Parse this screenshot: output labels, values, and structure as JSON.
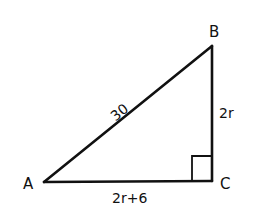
{
  "diagram": {
    "type": "right-triangle",
    "stroke_color": "#111111",
    "background": "#ffffff",
    "vertices": {
      "A": {
        "label": "A",
        "x": 44,
        "y": 182
      },
      "B": {
        "label": "B",
        "x": 212,
        "y": 46
      },
      "C": {
        "label": "C",
        "x": 212,
        "y": 181
      }
    },
    "sides": {
      "AB": {
        "label": "30"
      },
      "BC": {
        "label": "2r"
      },
      "AC": {
        "label": "2r+6"
      }
    },
    "right_angle_at": "C"
  }
}
